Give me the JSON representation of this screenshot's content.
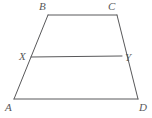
{
  "figure": {
    "type": "geometry-diagram",
    "canvas": {
      "width": 152,
      "height": 118,
      "background": "#ffffff"
    },
    "stroke": {
      "color": "#58585a",
      "width": 1
    },
    "points": {
      "A": {
        "x": 14,
        "y": 99,
        "label": "A"
      },
      "B": {
        "x": 48,
        "y": 15,
        "label": "B"
      },
      "C": {
        "x": 117,
        "y": 15,
        "label": "C"
      },
      "D": {
        "x": 138,
        "y": 99,
        "label": "D"
      },
      "X": {
        "x": 31,
        "y": 57,
        "label": "X"
      },
      "Y": {
        "x": 122,
        "y": 56,
        "label": "Y"
      }
    },
    "segments": [
      {
        "name": "AB",
        "from": "A",
        "to": "B"
      },
      {
        "name": "BC",
        "from": "B",
        "to": "C"
      },
      {
        "name": "CD",
        "from": "C",
        "to": "D"
      },
      {
        "name": "AD",
        "from": "A",
        "to": "D"
      },
      {
        "name": "XY",
        "from": "X",
        "to": "Y"
      }
    ],
    "labels": {
      "A": "A",
      "B": "B",
      "C": "C",
      "D": "D",
      "X": "X",
      "Y": "Y"
    }
  }
}
